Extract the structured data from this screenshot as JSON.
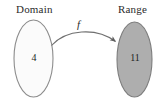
{
  "figure": {
    "type": "function-mapping-diagram",
    "background_color": "#ffffff"
  },
  "domain": {
    "label": "Domain",
    "element": "4",
    "shape": "ellipse",
    "fill_color": "#fbfbfb",
    "stroke_color": "#8c8c8c"
  },
  "range": {
    "label": "Range",
    "element": "11",
    "shape": "ellipse",
    "fill_color": "#aeaeae",
    "stroke_color": "#7d7d7d"
  },
  "mapping": {
    "label": "f",
    "arrow_color": "#6f6f6f",
    "direction": "domain-to-range"
  }
}
